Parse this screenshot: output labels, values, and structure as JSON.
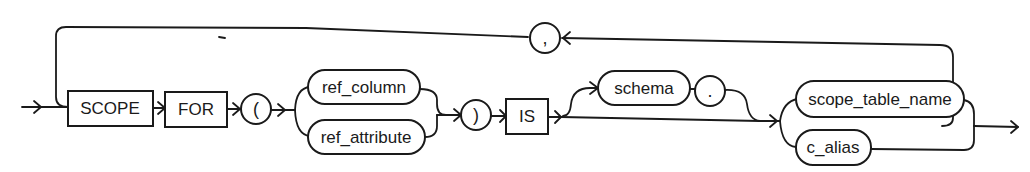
{
  "diagram": {
    "type": "railroad-syntax-diagram",
    "keywords": {
      "scope": "SCOPE",
      "for": "FOR",
      "is": "IS"
    },
    "symbols": {
      "open_paren": "(",
      "close_paren": ")",
      "comma": ",",
      "dot": "."
    },
    "nonterminals": {
      "ref_column": "ref_column",
      "ref_attribute": "ref_attribute",
      "schema": "schema",
      "scope_table_name": "scope_table_name",
      "c_alias": "c_alias"
    },
    "colors": {
      "stroke": "#1a1a1a",
      "background": "#ffffff"
    }
  }
}
